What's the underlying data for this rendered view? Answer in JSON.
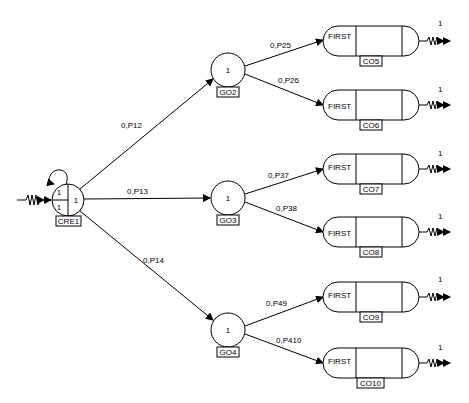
{
  "diagram": {
    "type": "petri-net / flow network",
    "source": {
      "id": "CRE1",
      "quadrant_values": [
        "1",
        "1",
        "1"
      ],
      "input_marker": "resistor-zigzag-arrow",
      "self_loop": true
    },
    "intermediate_nodes": [
      {
        "id": "GO2",
        "value": "1"
      },
      {
        "id": "GO3",
        "value": "1"
      },
      {
        "id": "GO4",
        "value": "1"
      }
    ],
    "sink_nodes": [
      {
        "id": "CO5",
        "text": "FIRST",
        "output_value": "1"
      },
      {
        "id": "CO6",
        "text": "FIRST",
        "output_value": "1"
      },
      {
        "id": "CO7",
        "text": "FIRST",
        "output_value": "1"
      },
      {
        "id": "CO8",
        "text": "FIRST",
        "output_value": "1"
      },
      {
        "id": "CO9",
        "text": "FIRST",
        "output_value": "1"
      },
      {
        "id": "CO10",
        "text": "FIRST",
        "output_value": "1"
      }
    ],
    "edges": [
      {
        "from": "CRE1",
        "to": "GO2",
        "label": "0,P12"
      },
      {
        "from": "CRE1",
        "to": "GO3",
        "label": "0,P13"
      },
      {
        "from": "CRE1",
        "to": "GO4",
        "label": "0,P14"
      },
      {
        "from": "GO2",
        "to": "CO5",
        "label": "0,P25"
      },
      {
        "from": "GO2",
        "to": "CO6",
        "label": "0,P26"
      },
      {
        "from": "GO3",
        "to": "CO7",
        "label": "0,P37"
      },
      {
        "from": "GO3",
        "to": "CO8",
        "label": "0,P38"
      },
      {
        "from": "GO4",
        "to": "CO9",
        "label": "0,P49"
      },
      {
        "from": "GO4",
        "to": "CO10",
        "label": "0,P410"
      }
    ]
  }
}
